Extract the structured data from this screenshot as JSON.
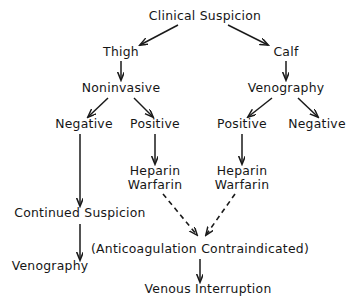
{
  "diagram": {
    "background_color": "#ffffff",
    "ink_color": "#1a1a1a",
    "width": 360,
    "height": 308,
    "nodes": [
      {
        "id": "clinical_suspicion",
        "label": "Clinical Suspicion",
        "x": 205,
        "y": 20,
        "level": 0
      },
      {
        "id": "thigh",
        "label": "Thigh",
        "x": 121,
        "y": 56,
        "level": 1
      },
      {
        "id": "calf",
        "label": "Calf",
        "x": 286,
        "y": 56,
        "level": 1
      },
      {
        "id": "noninvasive",
        "label": "Noninvasive",
        "x": 121,
        "y": 92,
        "level": 2
      },
      {
        "id": "venography_top",
        "label": "Venography",
        "x": 286,
        "y": 92,
        "level": 2
      },
      {
        "id": "negative_left",
        "label": "Negative",
        "x": 84,
        "y": 128,
        "level": 3
      },
      {
        "id": "positive_left",
        "label": "Positive",
        "x": 155,
        "y": 128,
        "level": 3
      },
      {
        "id": "positive_right",
        "label": "Positive",
        "x": 242,
        "y": 128,
        "level": 3
      },
      {
        "id": "negative_right",
        "label": "Negative",
        "x": 317,
        "y": 128,
        "level": 3
      },
      {
        "id": "heparin_left",
        "label": "Heparin",
        "x": 155,
        "y": 175,
        "level": 4
      },
      {
        "id": "warfarin_left",
        "label": "Warfarin",
        "x": 155,
        "y": 189,
        "level": 4
      },
      {
        "id": "heparin_right",
        "label": "Heparin",
        "x": 242,
        "y": 175,
        "level": 4
      },
      {
        "id": "warfarin_right",
        "label": "Warfarin",
        "x": 242,
        "y": 189,
        "level": 4
      },
      {
        "id": "continued_suspicion",
        "label": "Continued Suspicion",
        "x": 80,
        "y": 217,
        "level": 5
      },
      {
        "id": "anticoag_contraindicated",
        "label": "(Anticoagulation Contraindicated)",
        "x": 200,
        "y": 253,
        "level": 6
      },
      {
        "id": "venography_bottom",
        "label": "Venography",
        "x": 50,
        "y": 270,
        "level": 6
      },
      {
        "id": "venous_interruption",
        "label": "Venous Interruption",
        "x": 208,
        "y": 293,
        "level": 7
      }
    ],
    "edges": [
      {
        "id": "edge-clinical-to-thigh",
        "from": "clinical_suspicion",
        "to": "thigh",
        "style": "solid"
      },
      {
        "id": "edge-clinical-to-calf",
        "from": "clinical_suspicion",
        "to": "calf",
        "style": "solid"
      },
      {
        "id": "edge-thigh-to-noninvasive",
        "from": "thigh",
        "to": "noninvasive",
        "style": "solid"
      },
      {
        "id": "edge-calf-to-venography",
        "from": "calf",
        "to": "venography_top",
        "style": "solid"
      },
      {
        "id": "edge-noninvasive-to-negative",
        "from": "noninvasive",
        "to": "negative_left",
        "style": "solid"
      },
      {
        "id": "edge-noninvasive-to-positive",
        "from": "noninvasive",
        "to": "positive_left",
        "style": "solid"
      },
      {
        "id": "edge-venography-to-positive",
        "from": "venography_top",
        "to": "positive_right",
        "style": "solid"
      },
      {
        "id": "edge-venography-to-negative",
        "from": "venography_top",
        "to": "negative_right",
        "style": "solid"
      },
      {
        "id": "edge-positive-to-heparin-l",
        "from": "positive_left",
        "to": "heparin_left",
        "style": "solid"
      },
      {
        "id": "edge-positive-to-heparin-r",
        "from": "positive_right",
        "to": "heparin_right",
        "style": "solid"
      },
      {
        "id": "edge-negative-to-continued",
        "from": "negative_left",
        "to": "continued_suspicion",
        "style": "solid"
      },
      {
        "id": "edge-continued-to-venography",
        "from": "continued_suspicion",
        "to": "venography_bottom",
        "style": "solid"
      },
      {
        "id": "edge-warfarin-l-to-anticoag",
        "from": "warfarin_left",
        "to": "anticoag_contraindicated",
        "style": "dashed"
      },
      {
        "id": "edge-warfarin-r-to-anticoag",
        "from": "warfarin_right",
        "to": "anticoag_contraindicated",
        "style": "dashed"
      },
      {
        "id": "edge-anticoag-to-venous",
        "from": "anticoag_contraindicated",
        "to": "venous_interruption",
        "style": "solid"
      }
    ]
  }
}
